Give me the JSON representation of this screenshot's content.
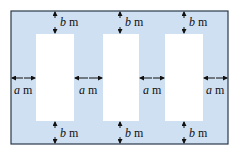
{
  "diagram": {
    "colors": {
      "fill": "#cfe0f3",
      "border": "#2a3a4a",
      "window": "#ffffff",
      "arrow": "#111111"
    },
    "outer": {
      "x": 11,
      "y": 11,
      "w": 217,
      "h": 133
    },
    "windows": [
      {
        "x": 36,
        "y": 34,
        "w": 38,
        "h": 87
      },
      {
        "x": 103,
        "y": 34,
        "w": 36,
        "h": 87
      },
      {
        "x": 165,
        "y": 34,
        "w": 38,
        "h": 87
      }
    ],
    "labels": {
      "b_var": "b",
      "a_var": "a",
      "unit": "m"
    },
    "b_labels_top": [
      {
        "x": 30,
        "y": 16
      },
      {
        "x": 122,
        "y": 16
      },
      {
        "x": 185,
        "y": 16
      }
    ],
    "b_labels_bottom": [
      {
        "x": 30,
        "y": 127
      },
      {
        "x": 122,
        "y": 127
      },
      {
        "x": 185,
        "y": 127
      }
    ],
    "a_labels": [
      {
        "x": 13,
        "y": 84
      },
      {
        "x": 80,
        "y": 84
      },
      {
        "x": 144,
        "y": 84
      },
      {
        "x": 206,
        "y": 84
      }
    ]
  }
}
